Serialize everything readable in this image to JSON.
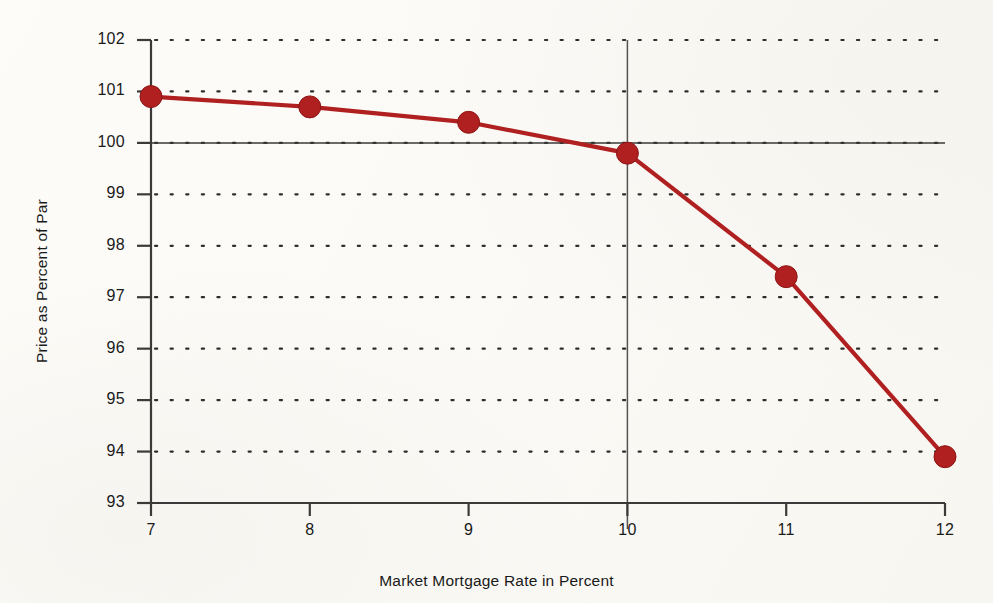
{
  "chart_data": {
    "type": "line",
    "title": "",
    "xlabel": "Market Mortgage Rate in Percent",
    "ylabel": "Price as Percent of Par",
    "x": [
      7,
      8,
      9,
      10,
      11,
      12
    ],
    "values": [
      100.9,
      100.7,
      100.4,
      99.8,
      97.4,
      93.9
    ],
    "series": [
      {
        "name": "Price as Percent of Par",
        "values": [
          100.9,
          100.7,
          100.4,
          99.8,
          97.4,
          93.9
        ]
      }
    ],
    "xlim": [
      7,
      12
    ],
    "ylim": [
      93,
      102
    ],
    "x_tick_labels": [
      "7",
      "8",
      "9",
      "10",
      "11",
      "12"
    ],
    "y_tick_labels": [
      "93",
      "94",
      "95",
      "96",
      "97",
      "98",
      "99",
      "100",
      "101",
      "102"
    ],
    "grid": "horizontal-dotted",
    "legend": "none",
    "reference_lines": [
      {
        "axis": "y",
        "value": 100,
        "style": "solid"
      },
      {
        "axis": "x",
        "value": 10,
        "style": "solid"
      }
    ],
    "colors": {
      "series": "#b02020",
      "marker": "#b02020",
      "axis": "#3a3a38",
      "grid": "#2e2e2c",
      "background": "#fbfaf7"
    },
    "marker": "circle"
  }
}
